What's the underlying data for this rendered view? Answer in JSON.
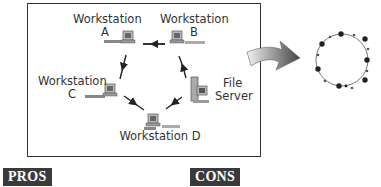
{
  "diagram": {
    "title_area": "Ring topology network",
    "nodes": [
      {
        "id": "A",
        "label_line1": "Workstation",
        "label_line2": "A",
        "icon": "workstation-icon"
      },
      {
        "id": "B",
        "label_line1": "Workstation",
        "label_line2": "B",
        "icon": "workstation-icon"
      },
      {
        "id": "C",
        "label_line1": "Workstation",
        "label_line2": "C",
        "icon": "workstation-icon"
      },
      {
        "id": "D",
        "label_line1": "Workstation D",
        "icon": "workstation-icon"
      },
      {
        "id": "FS",
        "label_line1": "File",
        "label_line2": "Server",
        "icon": "server-icon"
      }
    ],
    "edges": [
      {
        "from": "B",
        "to": "A"
      },
      {
        "from": "A",
        "to": "C"
      },
      {
        "from": "C",
        "to": "D"
      },
      {
        "from": "D",
        "to": "FS"
      },
      {
        "from": "FS",
        "to": "B"
      }
    ],
    "transition_arrow": "curved-arrow-icon",
    "ring_icon": {
      "large_nodes": 8,
      "small_nodes": 8
    }
  },
  "footer": {
    "pros_label": "PROS",
    "cons_label": "CONS"
  }
}
